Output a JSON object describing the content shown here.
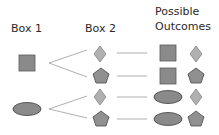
{
  "headers": {
    "box1": "Box 1",
    "box2": "Box 2",
    "outcomes_line1": "Possible",
    "outcomes_line2": "Outcomes"
  },
  "box1_items": [
    "square",
    "ellipse"
  ],
  "box2_items": [
    "diamond",
    "pentagon"
  ],
  "outcomes": [
    [
      "square",
      "diamond"
    ],
    [
      "square",
      "pentagon"
    ],
    [
      "ellipse",
      "diamond"
    ],
    [
      "ellipse",
      "pentagon"
    ]
  ],
  "colors": {
    "square": "#8a8a8a",
    "ellipse": "#8a8a8a",
    "diamond": "#b0b0b0",
    "pentagon": "#909090",
    "outline": "#5a5a5a",
    "line": "#9a9a9a"
  }
}
